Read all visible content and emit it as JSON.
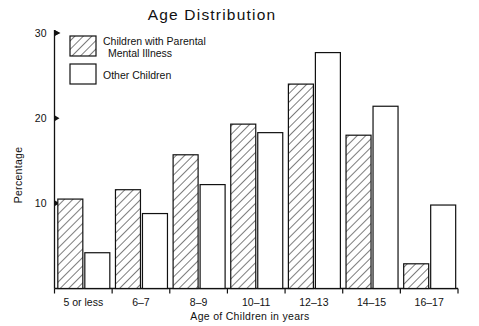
{
  "chart_data": {
    "type": "bar",
    "title": "Age  Distribution",
    "xlabel": "Age of  Children in years",
    "ylabel": "Percentage",
    "categories": [
      "5 or less",
      "6–7",
      "8–9",
      "10–11",
      "12–13",
      "14–15",
      "16–17"
    ],
    "series": [
      {
        "name": "Children with Parental Mental Illness",
        "name_line1": "Children with Parental",
        "name_line2": "Mental Illness",
        "style": "hatched",
        "values": [
          10.5,
          11.6,
          15.7,
          19.3,
          24.0,
          18.0,
          2.9
        ]
      },
      {
        "name": "Other Children",
        "name_line1": "Other Children",
        "name_line2": "",
        "style": "open",
        "values": [
          4.2,
          8.8,
          12.2,
          18.3,
          27.7,
          21.4,
          9.8
        ]
      }
    ],
    "ylim": [
      0,
      30
    ],
    "yticks": [
      10,
      20,
      30
    ],
    "ytick_labels": [
      "10",
      "20",
      "30"
    ],
    "grid": false,
    "legend_position": "top-left-inside",
    "colors": {
      "ink": "#111111",
      "background": "#ffffff",
      "bar_fill_open": "#ffffff",
      "bar_fill_hatch": "#ffffff"
    }
  }
}
